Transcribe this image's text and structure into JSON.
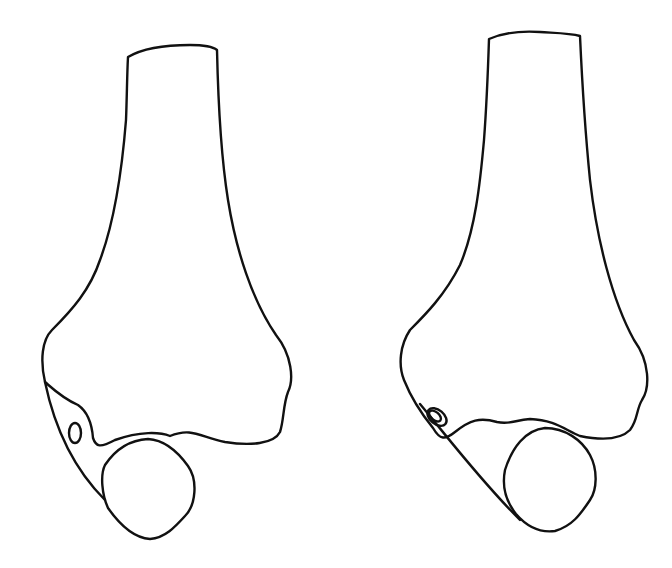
{
  "figure": {
    "stroke_color": "#111111",
    "background_color": "#ffffff",
    "panels": [
      {
        "id": "left",
        "feature": "small oval foramen near lateral condyle, separated from edge"
      },
      {
        "id": "right",
        "feature": "small oval foramen at the lateral edge, touching the outline"
      }
    ]
  }
}
